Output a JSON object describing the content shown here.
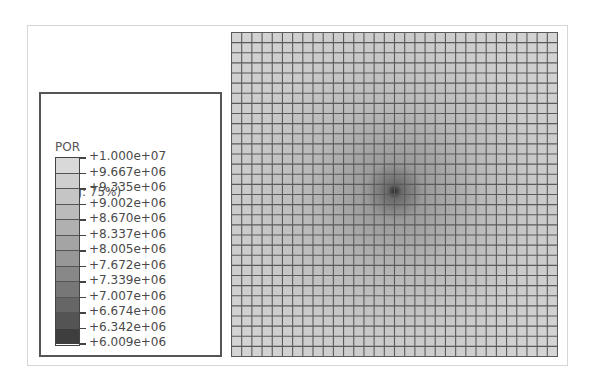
{
  "legend": {
    "variable": "POR",
    "averaging": "(Avg: 75%)",
    "values": [
      "+1.000e+07",
      "+9.667e+06",
      "+9.335e+06",
      "+9.002e+06",
      "+8.670e+06",
      "+8.337e+06",
      "+8.005e+06",
      "+7.672e+06",
      "+7.339e+06",
      "+7.007e+06",
      "+6.674e+06",
      "+6.342e+06",
      "+6.009e+06"
    ],
    "band_colors": [
      "#d9d9d9",
      "#cfcfcf",
      "#c5c5c5",
      "#bbbbbb",
      "#b0b0b0",
      "#a4a4a4",
      "#979797",
      "#888888",
      "#777777",
      "#666666",
      "#545454",
      "#3e3e3e"
    ]
  },
  "mesh": {
    "columns": 32,
    "rows": 32,
    "field_min_color": "#1a1a1a",
    "field_max_color": "#d4d4d4",
    "center_x": 0.5,
    "center_y": 0.49
  }
}
